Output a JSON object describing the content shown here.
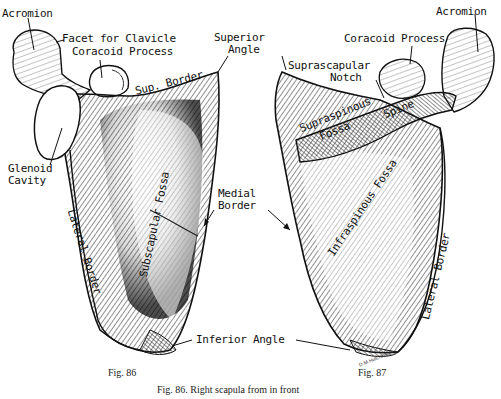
{
  "figure": {
    "left_figure_label": "Fig. 86",
    "right_figure_label": "Fig. 87",
    "caption": "Fig. 86. Right scapula from in front",
    "signature": "D.M.Hutchinson"
  },
  "left_labels": {
    "acromion": "Acromion",
    "facet_for_clavicle": "Facet for Clavicle",
    "coracoid_process": "Coracoid Process",
    "sup_border": "Sup. Border",
    "glenoid_cavity_line1": "Glenoid",
    "glenoid_cavity_line2": "Cavity",
    "lateral_border": "Lateral Border",
    "subscapular_fossa": "Subscapular Fossa"
  },
  "shared_labels": {
    "superior_angle_line1": "Superior",
    "superior_angle_line2": "Angle",
    "medial_border_line1": "Medial",
    "medial_border_line2": "Border",
    "inferior_angle": "Inferior Angle"
  },
  "right_labels": {
    "acromion": "Acromion",
    "coracoid_process": "Coracoid Process",
    "suprascapular_notch_line1": "Suprascapular",
    "suprascapular_notch_line2": "Notch",
    "supraspinous_fossa_line1": "Supraspinous",
    "supraspinous_fossa_line2": "Fossa",
    "spine": "Spine",
    "infraspinous_fossa": "Infraspinous Fossa",
    "lateral_border": "Lateral Border"
  },
  "colors": {
    "ink": "#111111",
    "shade": "#3a3a3a",
    "paper": "#ffffff"
  }
}
